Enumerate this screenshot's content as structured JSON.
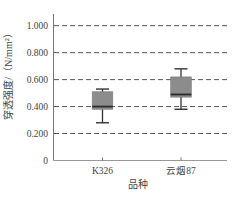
{
  "chart_data": {
    "type": "box",
    "title": "",
    "xlabel": "品种",
    "ylabel": "穿透强度/（N/mm²）",
    "ylim": [
      0,
      1.0
    ],
    "yticks": [
      0,
      0.2,
      0.4,
      0.6,
      0.8,
      1.0
    ],
    "ytick_labels": [
      "0",
      "0.200",
      "0.400",
      "0.600",
      "0.800",
      "1.000"
    ],
    "grid": "horizontal dashed",
    "categories": [
      "K326",
      "云烟87"
    ],
    "series": [
      {
        "name": "K326",
        "whisker_low": 0.28,
        "q1": 0.38,
        "median": 0.4,
        "q3": 0.51,
        "whisker_high": 0.53
      },
      {
        "name": "云烟87",
        "whisker_low": 0.38,
        "q1": 0.47,
        "median": 0.49,
        "q3": 0.62,
        "whisker_high": 0.68
      }
    ],
    "colors": {
      "box_fill": "#8c8c8c",
      "median": "#2b2b2b",
      "whisker": "#333333",
      "grid": "#555555",
      "axis": "#777777"
    }
  }
}
